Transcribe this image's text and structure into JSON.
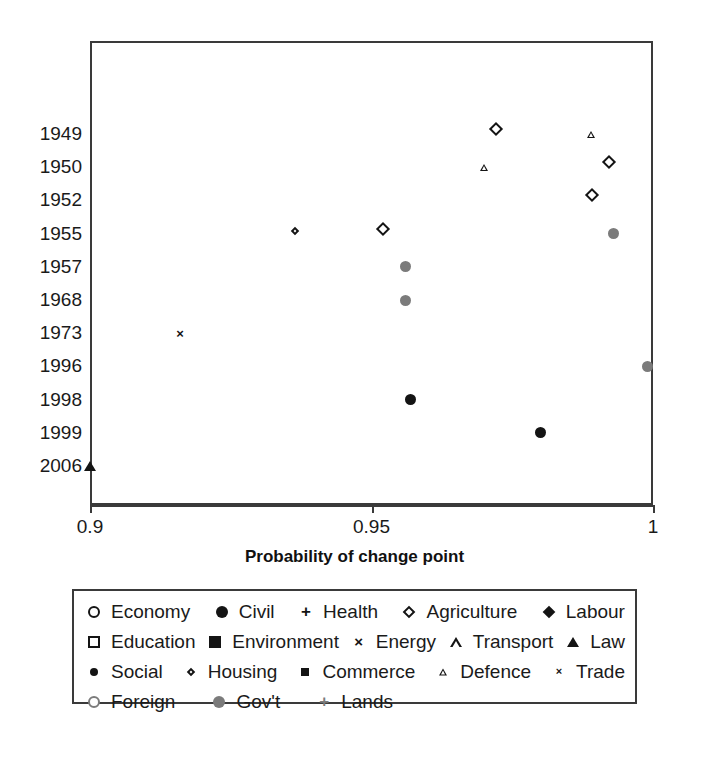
{
  "chart_data": {
    "type": "scatter",
    "title": "",
    "xlabel": "Probability of change point",
    "ylabel": "",
    "xlim": [
      0.9,
      1.0
    ],
    "xticks": [
      0.9,
      0.95,
      1
    ],
    "xtick_labels": [
      "0.9",
      "0.95",
      "1"
    ],
    "ytick_labels": [
      "1949",
      "1950",
      "1952",
      "1955",
      "1957",
      "1968",
      "1973",
      "1996",
      "1998",
      "1999",
      "2006"
    ],
    "y_categories": [
      "1949",
      "1950",
      "1952",
      "1955",
      "1957",
      "1968",
      "1973",
      "1996",
      "1998",
      "1999",
      "2006"
    ],
    "grid": false,
    "legend_position": "below",
    "points": [
      {
        "year": "1949",
        "x": 0.973,
        "series": "Agriculture",
        "marker": "diamond-open",
        "size": 14
      },
      {
        "year": "1949",
        "x": 0.989,
        "series": "Defence",
        "marker": "triangle-open",
        "size": 9
      },
      {
        "year": "1950",
        "x": 0.97,
        "series": "Defence",
        "marker": "triangle-open",
        "size": 9
      },
      {
        "year": "1950",
        "x": 0.993,
        "series": "Agriculture",
        "marker": "diamond-open",
        "size": 14
      },
      {
        "year": "1952",
        "x": 0.99,
        "series": "Agriculture",
        "marker": "diamond-open",
        "size": 14
      },
      {
        "year": "1955",
        "x": 0.937,
        "series": "Housing",
        "marker": "diamond-open-small",
        "size": 9
      },
      {
        "year": "1955",
        "x": 0.953,
        "series": "Agriculture",
        "marker": "diamond-open",
        "size": 14
      },
      {
        "year": "1955",
        "x": 0.993,
        "series": "Gov't",
        "marker": "circle-gray",
        "size": 11
      },
      {
        "year": "1957",
        "x": 0.956,
        "series": "Gov't",
        "marker": "circle-gray",
        "size": 11
      },
      {
        "year": "1968",
        "x": 0.956,
        "series": "Gov't",
        "marker": "circle-gray",
        "size": 11
      },
      {
        "year": "1973",
        "x": 0.916,
        "series": "Trade",
        "marker": "x-small",
        "size": 10
      },
      {
        "year": "1996",
        "x": 0.999,
        "series": "Gov't",
        "marker": "circle-gray",
        "size": 11
      },
      {
        "year": "1998",
        "x": 0.957,
        "series": "Civil",
        "marker": "circle-fill",
        "size": 11
      },
      {
        "year": "1999",
        "x": 0.98,
        "series": "Civil",
        "marker": "circle-fill",
        "size": 11
      },
      {
        "year": "2006",
        "x": 0.9,
        "series": "Law",
        "marker": "triangle-fill",
        "size": 12
      }
    ],
    "series_legend": [
      {
        "name": "Economy",
        "marker": "circle-open"
      },
      {
        "name": "Civil",
        "marker": "circle-fill"
      },
      {
        "name": "Health",
        "marker": "plus"
      },
      {
        "name": "Agriculture",
        "marker": "diamond-open"
      },
      {
        "name": "Labour",
        "marker": "diamond-fill"
      },
      {
        "name": "Education",
        "marker": "square-open"
      },
      {
        "name": "Environment",
        "marker": "square-fill"
      },
      {
        "name": "Energy",
        "marker": "x"
      },
      {
        "name": "Transport",
        "marker": "triangle-open"
      },
      {
        "name": "Law",
        "marker": "triangle-fill"
      },
      {
        "name": "Social",
        "marker": "circle-fill-small"
      },
      {
        "name": "Housing",
        "marker": "diamond-open-small"
      },
      {
        "name": "Commerce",
        "marker": "square-fill-small"
      },
      {
        "name": "Defence",
        "marker": "triangle-open-small"
      },
      {
        "name": "Trade",
        "marker": "x-small"
      },
      {
        "name": "Foreign",
        "marker": "circle-open-gray"
      },
      {
        "name": "Gov't",
        "marker": "circle-gray"
      },
      {
        "name": "Lands",
        "marker": "plus-gray"
      }
    ],
    "colors": {
      "marker_black": "#141414",
      "marker_gray": "#7b7b7b",
      "axis": "#3a3a3a",
      "background": "#ffffff"
    }
  },
  "axis": {
    "x_title": "Probability of change point"
  },
  "legend": {
    "rows": [
      [
        "Economy",
        "Civil",
        "Health",
        "Agriculture",
        "Labour"
      ],
      [
        "Education",
        "Environment",
        "Energy",
        "Transport",
        "Law"
      ],
      [
        "Social",
        "Housing",
        "Commerce",
        "Defence",
        "Trade"
      ],
      [
        "Foreign",
        "Gov't",
        "Lands"
      ]
    ]
  }
}
